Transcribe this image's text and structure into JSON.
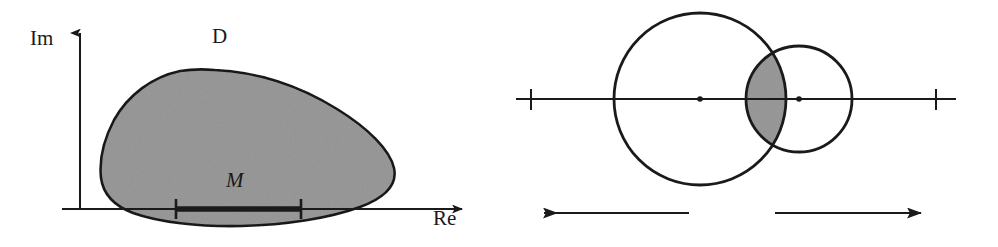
{
  "figure": {
    "title_visible": false,
    "background_color": "#ffffff",
    "stroke_color": "#1a1a1a",
    "fill_gray": "#9a9a9a",
    "panels": [
      {
        "id": "left-panel",
        "name": "complex-domain-panel",
        "description": "Shaded convex-like domain D in the complex plane with real segment M on the real axis",
        "labels": {
          "imaginary_axis": "Im",
          "real_axis": "Re",
          "domain": "D",
          "segment": "M"
        },
        "axes": {
          "origin": {
            "x": 80,
            "y": 209
          },
          "im_axis_top_y": 27,
          "re_axis_right_x": 470
        },
        "segment_M": {
          "x_start": 176,
          "x_end": 301,
          "y": 209,
          "has_end_ticks": true
        },
        "domain_D": {
          "filled": true,
          "fill": "#9a9a9a",
          "outline": "#1a1a1a"
        }
      },
      {
        "id": "right-panel",
        "name": "two-disks-panel",
        "description": "Two overlapping circles centered at a1 and a2 on a real line; their lens-shaped intersection is shaded. Two arrows below point outward with label M between them.",
        "labels": {
          "center_1": "a",
          "center_1_subscript": "1",
          "center_2": "a",
          "center_2_subscript": "2",
          "segment": "M"
        },
        "real_line": {
          "y": 99,
          "x_start": 516,
          "x_end": 956,
          "ticks": [
            531,
            936
          ]
        },
        "circles": [
          {
            "name": "circle-a1",
            "cx": 700,
            "cy": 99,
            "r": 86,
            "center_label": "a1"
          },
          {
            "name": "circle-a2",
            "cx": 799,
            "cy": 99,
            "r": 53,
            "center_label": "a2"
          }
        ],
        "intersection": {
          "shaded": true,
          "fill": "#9a9a9a",
          "top_point": {
            "x": 746,
            "y": 52
          },
          "bottom_point": {
            "x": 746,
            "y": 146
          }
        },
        "arrows": [
          {
            "name": "left-arrow",
            "from_x": 689,
            "to_x": 540,
            "y": 213,
            "direction": "left"
          },
          {
            "name": "right-arrow",
            "from_x": 775,
            "to_x": 925,
            "y": 213,
            "direction": "right"
          }
        ]
      }
    ]
  }
}
